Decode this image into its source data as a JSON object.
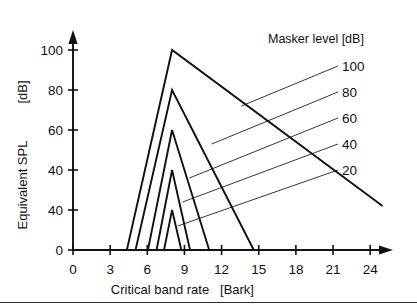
{
  "figure": {
    "background": "#ffffff",
    "ink": "#111111"
  },
  "chart_data": {
    "type": "line",
    "title": "",
    "xlabel_main": "Critical band rate",
    "xlabel_unit": "[Bark]",
    "ylabel_main": "Equivalent SPL",
    "ylabel_unit": "[dB]",
    "legend_title": "Masker level [dB]",
    "legend_position": "upper-right",
    "grid": false,
    "xlim": [
      0,
      25.6
    ],
    "ylim": [
      0,
      108
    ],
    "xticks": [
      0,
      3,
      6,
      9,
      12,
      15,
      18,
      21,
      24
    ],
    "xticklabels": [
      "0",
      "3",
      "6",
      "9",
      "12",
      "15",
      "18",
      "21",
      "24"
    ],
    "yticks": [
      0,
      20,
      40,
      60,
      80,
      100
    ],
    "yticklabels": [
      "0",
      "40",
      "40",
      "60",
      "80",
      "100"
    ],
    "legend_entries": [
      "100",
      "80",
      "60",
      "40",
      "20"
    ],
    "series": [
      {
        "name": "100",
        "masker_level": 100,
        "x": [
          4.35,
          8.0,
          25.0
        ],
        "y": [
          0,
          100,
          22
        ]
      },
      {
        "name": "80",
        "masker_level": 80,
        "x": [
          5.05,
          8.0,
          14.6
        ],
        "y": [
          0,
          80,
          0
        ]
      },
      {
        "name": "60",
        "masker_level": 60,
        "x": [
          6.05,
          8.0,
          11.0
        ],
        "y": [
          0,
          60,
          0
        ]
      },
      {
        "name": "40",
        "masker_level": 40,
        "x": [
          6.75,
          8.0,
          9.45
        ],
        "y": [
          0,
          40,
          0
        ]
      },
      {
        "name": "20",
        "masker_level": 20,
        "x": [
          7.35,
          8.0,
          8.75
        ],
        "y": [
          0,
          20,
          0
        ]
      }
    ],
    "leaders": [
      {
        "name": "100",
        "x1": 13.6,
        "y1": 72,
        "x2": 21.4,
        "y2": 92
      },
      {
        "name": "80",
        "x1": 11.2,
        "y1": 53,
        "x2": 21.4,
        "y2": 79
      },
      {
        "name": "60",
        "x1": 9.4,
        "y1": 36,
        "x2": 21.4,
        "y2": 66
      },
      {
        "name": "40",
        "x1": 8.85,
        "y1": 24,
        "x2": 21.4,
        "y2": 53
      },
      {
        "name": "20",
        "x1": 8.45,
        "y1": 12,
        "x2": 21.4,
        "y2": 40
      }
    ]
  }
}
